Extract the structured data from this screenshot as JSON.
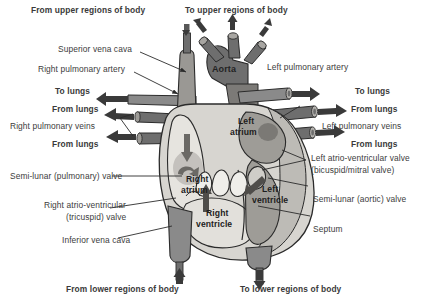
{
  "diagram": {
    "type": "anatomical-diagram",
    "background_color": "#ffffff",
    "palette": {
      "heart_body": "#d7d5d0",
      "heart_body_dark": "#b9b7b1",
      "chamber_light": "#e6e4df",
      "vessel_dark": "#6e6e6e",
      "vessel_mid": "#8a8a8a",
      "vessel_light": "#b0aeaa",
      "outline": "#2b2b2b",
      "label_text": "#3c3c3c",
      "arrow_fill": "#585858"
    }
  },
  "external_labels": {
    "from_upper_regions": "From upper regions of body",
    "to_upper_regions": "To upper regions of body",
    "superior_vena_cava": "Superior vena cava",
    "right_pulmonary_artery": "Right pulmonary artery",
    "to_lungs_left": "To lungs",
    "left_pulmonary_artery": "Left pulmonary artery",
    "to_lungs_right": "To lungs",
    "from_lungs_right_upper": "From lungs",
    "right_pulmonary_veins": "Right pulmonary veins",
    "from_lungs_right_lower": "From lungs",
    "from_lungs_left_upper": "From lungs",
    "left_pulmonary_veins": "Left pulmonary veins",
    "from_lungs_left_lower": "From lungs",
    "semilunar_pulmonary_valve": "Semi-lunar (pulmonary) valve",
    "right_atrioventricular_valve_line1": "Right atrio-ventricular",
    "right_atrioventricular_valve_line2": "(tricuspid) valve",
    "inferior_vena_cava": "Inferior vena cava",
    "left_atrioventricular_valve_line1": "Left atrio-ventricular valve",
    "left_atrioventricular_valve_line2": "(bicuspid/mitral valve)",
    "semilunar_aortic_valve": "Semi-lunar (aortic) valve",
    "septum": "Septum",
    "from_lower_regions": "From lower regions of body",
    "to_lower_regions": "To lower regions of body"
  },
  "internal_labels": {
    "aorta": "Aorta",
    "left_atrium_line1": "Left",
    "left_atrium_line2": "atrium",
    "right_atrium_line1": "Right",
    "right_atrium_line2": "atrium",
    "left_ventricle_line1": "Left",
    "left_ventricle_line2": "ventricle",
    "right_ventricle_line1": "Right",
    "right_ventricle_line2": "ventricle"
  },
  "flow_arrows": [
    {
      "name": "svc-inflow-down",
      "direction": "down",
      "vessel": "superior vena cava"
    },
    {
      "name": "aorta-branch-left-arrow",
      "direction": "up-left",
      "vessel": "brachiocephalic"
    },
    {
      "name": "aorta-branch-mid-arrow",
      "direction": "up",
      "vessel": "carotid"
    },
    {
      "name": "aorta-branch-right-arrow",
      "direction": "up-right",
      "vessel": "subclavian"
    },
    {
      "name": "right-pulmonary-artery-arrow",
      "direction": "left",
      "vessel": "right pulmonary artery"
    },
    {
      "name": "left-pulmonary-artery-arrow",
      "direction": "right",
      "vessel": "left pulmonary artery"
    },
    {
      "name": "right-pulmonary-vein-upper-arrow",
      "direction": "right",
      "vessel": "right pulmonary vein"
    },
    {
      "name": "right-pulmonary-vein-lower-arrow",
      "direction": "right",
      "vessel": "right pulmonary vein"
    },
    {
      "name": "left-pulmonary-vein-upper-arrow",
      "direction": "left",
      "vessel": "left pulmonary vein"
    },
    {
      "name": "left-pulmonary-vein-lower-arrow",
      "direction": "left",
      "vessel": "left pulmonary vein"
    },
    {
      "name": "right-atrium-flow-arrow",
      "direction": "down",
      "chamber": "right atrium"
    },
    {
      "name": "right-atrium-curl-arrow",
      "direction": "curl",
      "chamber": "right atrium"
    },
    {
      "name": "right-ventricle-flow-arrow",
      "direction": "up",
      "chamber": "right ventricle"
    },
    {
      "name": "left-ventricle-flow-arrow",
      "direction": "down-left",
      "chamber": "left ventricle"
    },
    {
      "name": "ivc-inflow-up",
      "direction": "up",
      "vessel": "inferior vena cava"
    },
    {
      "name": "descending-aorta-outflow",
      "direction": "down",
      "vessel": "descending aorta"
    }
  ]
}
